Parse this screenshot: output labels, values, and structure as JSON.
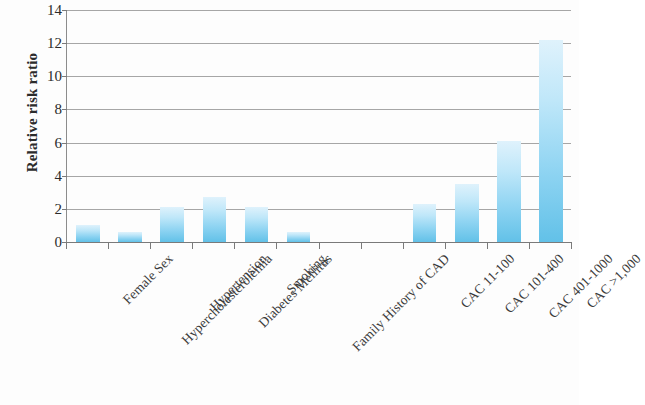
{
  "chart_data": {
    "type": "bar",
    "title": "",
    "xlabel": "",
    "ylabel": "Relative risk ratio",
    "ylim": [
      0,
      14
    ],
    "yticks": [
      0,
      2,
      4,
      6,
      8,
      10,
      12,
      14
    ],
    "ytick_labels": [
      "0",
      "2",
      "4",
      "6",
      "8",
      "10",
      "12",
      "14"
    ],
    "grid": true,
    "legend": "none",
    "categories": [
      "Female Sex",
      "Hypercholesterolemia",
      "Hypertension",
      "Diabetes Mellitus",
      "Smoking",
      "Family History of CAD",
      "",
      "",
      "CAC 11-100",
      "CAC 101-400",
      "CAC 401-1000",
      "CAC >1,000"
    ],
    "values": [
      1.0,
      0.6,
      2.1,
      2.7,
      2.1,
      0.6,
      null,
      null,
      2.3,
      3.5,
      6.1,
      12.2
    ],
    "bar_color_top": "#dff2fc",
    "bar_color_bottom": "#62c1e8",
    "axis_color": "#7a7a7a",
    "grid_color": "#a6a6a6"
  }
}
